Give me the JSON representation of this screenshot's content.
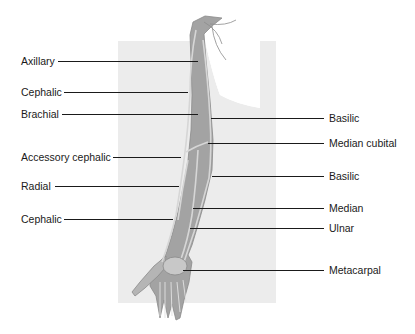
{
  "figure": {
    "colors": {
      "background_panel": "#ececec",
      "arm_fill": "#9a9a9a",
      "vein_highlight": "#d8d8d8",
      "leader": "#1a1a1a",
      "text": "#1a1a1a"
    }
  },
  "labels_left": [
    {
      "text": "Axillary",
      "x": 21,
      "y": 55,
      "line_x1": 58,
      "line_x2": 198,
      "line_y": 61
    },
    {
      "text": "Cephalic",
      "x": 21,
      "y": 86,
      "line_x1": 64,
      "line_x2": 188,
      "line_y": 92
    },
    {
      "text": "Brachial",
      "x": 21,
      "y": 108,
      "line_x1": 62,
      "line_x2": 198,
      "line_y": 114
    },
    {
      "text": "Accessory cephalic",
      "x": 21,
      "y": 151,
      "line_x1": 113,
      "line_x2": 181,
      "line_y": 157
    },
    {
      "text": "Radial",
      "x": 21,
      "y": 180,
      "line_x1": 55,
      "line_x2": 179,
      "line_y": 186
    },
    {
      "text": "Cephalic",
      "x": 21,
      "y": 213,
      "line_x1": 64,
      "line_x2": 173,
      "line_y": 219
    }
  ],
  "labels_right": [
    {
      "text": "Basilic",
      "x": 329,
      "y": 112,
      "line_x1": 211,
      "line_x2": 324,
      "line_y": 118
    },
    {
      "text": "Median cubital",
      "x": 329,
      "y": 137,
      "line_x1": 208,
      "line_x2": 324,
      "line_y": 143
    },
    {
      "text": "Basilic",
      "x": 329,
      "y": 170,
      "line_x1": 212,
      "line_x2": 324,
      "line_y": 176
    },
    {
      "text": "Median",
      "x": 329,
      "y": 202,
      "line_x1": 193,
      "line_x2": 324,
      "line_y": 208
    },
    {
      "text": "Ulnar",
      "x": 329,
      "y": 222,
      "line_x1": 190,
      "line_x2": 324,
      "line_y": 228
    },
    {
      "text": "Metacarpal",
      "x": 329,
      "y": 264,
      "line_x1": 183,
      "line_x2": 324,
      "line_y": 270
    }
  ]
}
